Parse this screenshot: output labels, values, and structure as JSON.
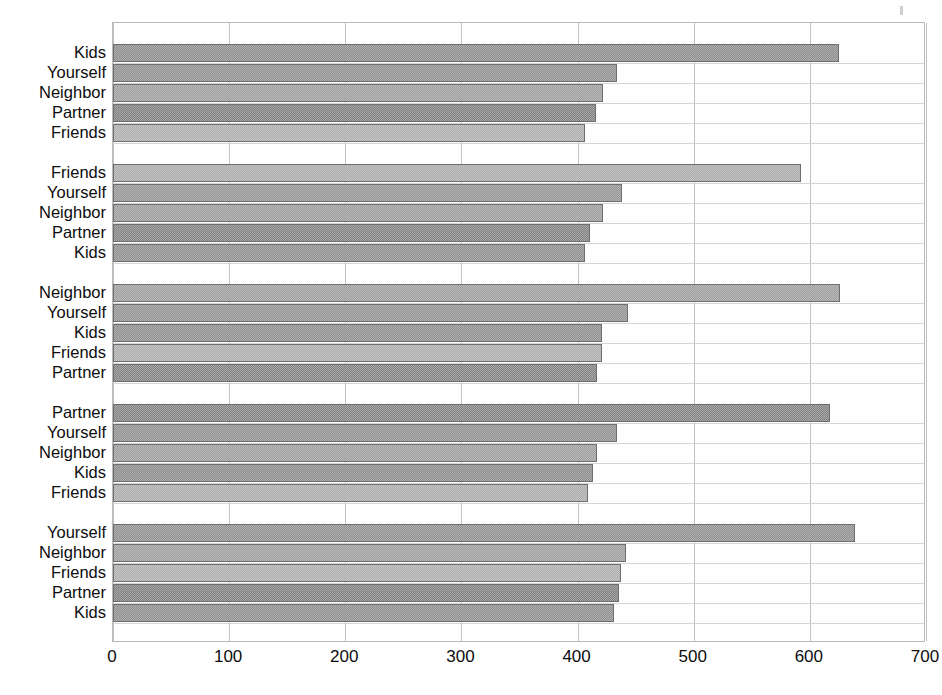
{
  "chart_data": {
    "type": "bar",
    "orientation": "horizontal",
    "title": "",
    "subtitle": "",
    "xlabel": "",
    "ylabel": "",
    "xlim": [
      0,
      700
    ],
    "ylim": null,
    "grid": true,
    "legend": false,
    "legend_position": "none",
    "xticks": [
      0,
      100,
      200,
      300,
      400,
      500,
      600,
      700
    ],
    "xtick_labels": [
      "0",
      "100",
      "200",
      "300",
      "400",
      "500",
      "600",
      "700"
    ],
    "categories": [
      "Kids",
      "Yourself",
      "Neighbor",
      "Partner",
      "Friends"
    ],
    "groups": [
      {
        "name": "Kids",
        "bars": [
          {
            "label": "Kids",
            "value": 625,
            "shade": "#8d8d8d"
          },
          {
            "label": "Yourself",
            "value": 434,
            "shade": "#8f8f8f"
          },
          {
            "label": "Neighbor",
            "value": 422,
            "shade": "#9e9e9e"
          },
          {
            "label": "Partner",
            "value": 416,
            "shade": "#808080"
          },
          {
            "label": "Friends",
            "value": 406,
            "shade": "#adadad"
          }
        ]
      },
      {
        "name": "Friends",
        "bars": [
          {
            "label": "Friends",
            "value": 592,
            "shade": "#ababab"
          },
          {
            "label": "Yourself",
            "value": 438,
            "shade": "#949494"
          },
          {
            "label": "Neighbor",
            "value": 422,
            "shade": "#9c9c9c"
          },
          {
            "label": "Partner",
            "value": 411,
            "shade": "#838383"
          },
          {
            "label": "Kids",
            "value": 406,
            "shade": "#8e8e8e"
          }
        ]
      },
      {
        "name": "Neighbor",
        "bars": [
          {
            "label": "Neighbor",
            "value": 626,
            "shade": "#9d9d9d"
          },
          {
            "label": "Yourself",
            "value": 443,
            "shade": "#929292"
          },
          {
            "label": "Kids",
            "value": 421,
            "shade": "#8e8e8e"
          },
          {
            "label": "Friends",
            "value": 421,
            "shade": "#acacac"
          },
          {
            "label": "Partner",
            "value": 417,
            "shade": "#828282"
          }
        ]
      },
      {
        "name": "Partner",
        "bars": [
          {
            "label": "Partner",
            "value": 617,
            "shade": "#838383"
          },
          {
            "label": "Yourself",
            "value": 434,
            "shade": "#8f8f8f"
          },
          {
            "label": "Neighbor",
            "value": 417,
            "shade": "#9d9d9d"
          },
          {
            "label": "Kids",
            "value": 413,
            "shade": "#8b8b8b"
          },
          {
            "label": "Friends",
            "value": 409,
            "shade": "#ababab"
          }
        ]
      },
      {
        "name": "Yourself",
        "bars": [
          {
            "label": "Yourself",
            "value": 639,
            "shade": "#8f8f8f"
          },
          {
            "label": "Neighbor",
            "value": 442,
            "shade": "#9d9d9d"
          },
          {
            "label": "Friends",
            "value": 437,
            "shade": "#adadad"
          },
          {
            "label": "Partner",
            "value": 436,
            "shade": "#818181"
          },
          {
            "label": "Kids",
            "value": 431,
            "shade": "#8e8e8e"
          }
        ]
      }
    ]
  },
  "axis": {
    "x_start_px": 112,
    "x_end_px": 925,
    "plot_top_px": 22,
    "plot_height_px": 620
  }
}
